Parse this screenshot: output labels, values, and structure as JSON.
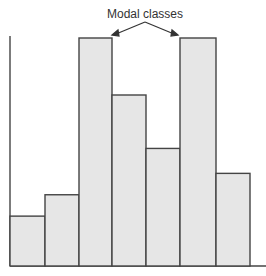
{
  "chart_data": {
    "type": "bar",
    "title": "",
    "xlabel": "",
    "ylabel": "",
    "annotation": "Modal classes",
    "categories": [
      "1",
      "2",
      "3",
      "4",
      "5",
      "6",
      "7"
    ],
    "values": [
      1.4,
      2.0,
      6.4,
      4.8,
      3.3,
      6.4,
      2.6
    ],
    "modal_indices": [
      2,
      5
    ],
    "grid": false,
    "legend": null,
    "colors": {
      "fill": "#e6e6e6",
      "stroke": "#444444"
    }
  }
}
